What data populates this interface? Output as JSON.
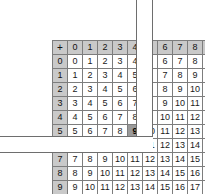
{
  "figure": {
    "name": "addition-table",
    "operator_symbol": "+",
    "selected_cell": {
      "row": 5,
      "col": 4,
      "value": 9
    },
    "hidden_column_index": 5,
    "hidden_row_index": 6,
    "colors": {
      "header_background": "#c9c9c9",
      "cell_background": "#ffffff",
      "grid_line": "#7d7d7d",
      "selected_background": "#9a9a9a",
      "occluder_fill": "#ffffff",
      "occluder_border": "#6e6e6e",
      "text": "#1a1a1a"
    }
  },
  "chart_data": {
    "type": "table",
    "title": "",
    "xlabel": "",
    "ylabel": "",
    "column_headers": [
      "+",
      "0",
      "1",
      "2",
      "3",
      "4",
      "5",
      "6",
      "7",
      "8",
      "9"
    ],
    "row_headers": [
      "0",
      "1",
      "2",
      "3",
      "4",
      "5",
      "6",
      "7",
      "8",
      "9"
    ],
    "rows": [
      [
        "0",
        "0",
        "1",
        "2",
        "3",
        "4",
        "5",
        "6",
        "7",
        "8",
        "9"
      ],
      [
        "1",
        "1",
        "2",
        "3",
        "4",
        "5",
        "6",
        "7",
        "8",
        "9",
        "10"
      ],
      [
        "2",
        "2",
        "3",
        "4",
        "5",
        "6",
        "7",
        "8",
        "9",
        "10",
        "11"
      ],
      [
        "3",
        "3",
        "4",
        "5",
        "6",
        "7",
        "8",
        "9",
        "10",
        "11",
        "12"
      ],
      [
        "4",
        "4",
        "5",
        "6",
        "7",
        "8",
        "9",
        "10",
        "11",
        "12",
        "13"
      ],
      [
        "5",
        "5",
        "6",
        "7",
        "8",
        "9",
        "10",
        "11",
        "12",
        "13",
        "14"
      ],
      [
        "6",
        "6",
        "7",
        "8",
        "9",
        "10",
        "11",
        "12",
        "13",
        "14",
        "15"
      ],
      [
        "7",
        "7",
        "8",
        "9",
        "10",
        "11",
        "12",
        "13",
        "14",
        "15",
        "16"
      ],
      [
        "8",
        "8",
        "9",
        "10",
        "11",
        "12",
        "13",
        "14",
        "15",
        "16",
        "17"
      ],
      [
        "9",
        "9",
        "10",
        "11",
        "12",
        "13",
        "14",
        "15",
        "16",
        "17",
        "18"
      ]
    ],
    "occluders": [
      {
        "name": "vertical-strip",
        "covers": "column-5-rows-header-through-6"
      },
      {
        "name": "horizontal-strip",
        "covers": "row-6-columns-left-through-5"
      }
    ]
  }
}
